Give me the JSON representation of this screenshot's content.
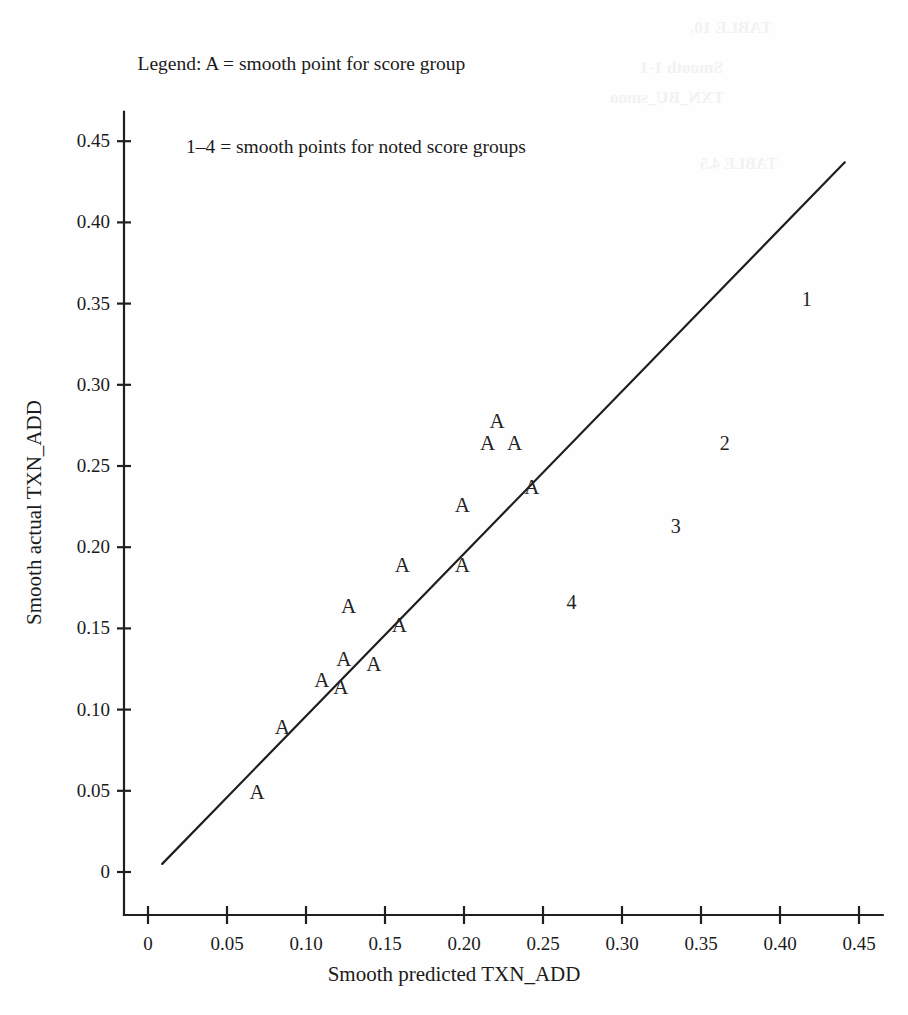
{
  "legend": {
    "line1": "Legend: A = smooth point for score group",
    "line2": "1–4 = smooth points for noted score groups"
  },
  "bleed_artifacts": [
    {
      "text": "TABLE 10.",
      "x": 690,
      "y": 18,
      "size": 17
    },
    {
      "text": "Smooth 1-1",
      "x": 640,
      "y": 58,
      "size": 17
    },
    {
      "text": "TXN_BU_smoo",
      "x": 610,
      "y": 88,
      "size": 17
    },
    {
      "text": "TABLE 4.5",
      "x": 700,
      "y": 155,
      "size": 16
    }
  ],
  "chart_data": {
    "type": "scatter",
    "title": "",
    "xlabel": "Smooth predicted TXN_ADD",
    "ylabel": "Smooth actual TXN_ADD",
    "xlim": [
      0,
      0.465
    ],
    "ylim": [
      0,
      0.468
    ],
    "xticks": [
      0,
      0.05,
      0.1,
      0.15,
      0.2,
      0.25,
      0.3,
      0.35,
      0.4,
      0.45
    ],
    "yticks": [
      0,
      0.05,
      0.1,
      0.15,
      0.2,
      0.25,
      0.3,
      0.35,
      0.4,
      0.45
    ],
    "xticklabels": [
      "0",
      "0.05",
      "0.10",
      "0.15",
      "0.20",
      "0.25",
      "0.30",
      "0.35",
      "0.40",
      "0.45"
    ],
    "yticklabels": [
      "0",
      "0.05",
      "0.10",
      "0.15",
      "0.20",
      "0.25",
      "0.30",
      "0.35",
      "0.40",
      "0.45"
    ],
    "grid": false,
    "legend_position": "top-left",
    "reference_line": {
      "label": "45-degree reference line",
      "x": [
        0.009,
        0.441
      ],
      "y": [
        0.005,
        0.437
      ],
      "color": "#1f1f1f",
      "width": 2.2
    },
    "series": [
      {
        "name": "A = smooth point for score group",
        "marker": "A",
        "color": "#232323",
        "points": [
          {
            "label": "A",
            "x": 0.069,
            "y": 0.049
          },
          {
            "label": "A",
            "x": 0.085,
            "y": 0.089
          },
          {
            "label": "A",
            "x": 0.11,
            "y": 0.118
          },
          {
            "label": "A",
            "x": 0.122,
            "y": 0.114
          },
          {
            "label": "A",
            "x": 0.124,
            "y": 0.131
          },
          {
            "label": "A",
            "x": 0.143,
            "y": 0.128
          },
          {
            "label": "A",
            "x": 0.127,
            "y": 0.164
          },
          {
            "label": "A",
            "x": 0.159,
            "y": 0.152
          },
          {
            "label": "A",
            "x": 0.161,
            "y": 0.189
          },
          {
            "label": "A",
            "x": 0.199,
            "y": 0.189
          },
          {
            "label": "A",
            "x": 0.199,
            "y": 0.226
          },
          {
            "label": "A",
            "x": 0.243,
            "y": 0.237
          },
          {
            "label": "A",
            "x": 0.215,
            "y": 0.264
          },
          {
            "label": "A",
            "x": 0.232,
            "y": 0.264
          },
          {
            "label": "A",
            "x": 0.221,
            "y": 0.278
          }
        ]
      },
      {
        "name": "1–4 = smooth points for noted score groups",
        "marker": "number",
        "color": "#232323",
        "points": [
          {
            "label": "1",
            "x": 0.417,
            "y": 0.353
          },
          {
            "label": "2",
            "x": 0.365,
            "y": 0.264
          },
          {
            "label": "3",
            "x": 0.334,
            "y": 0.213
          },
          {
            "label": "4",
            "x": 0.268,
            "y": 0.166
          }
        ]
      }
    ]
  }
}
